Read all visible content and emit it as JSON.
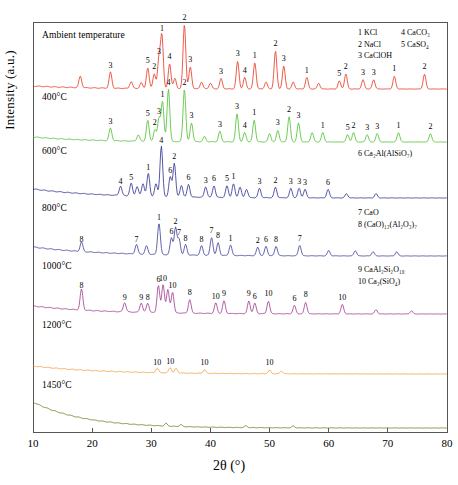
{
  "chart_data": {
    "type": "line",
    "title": "",
    "xlabel": "2θ (°)",
    "ylabel": "Intensity (a.u.)",
    "xlim": [
      10,
      80
    ],
    "xticks": [
      10,
      20,
      30,
      40,
      50,
      60,
      70,
      80
    ],
    "grid": false,
    "legend_position": "inside-right",
    "phase_legend": [
      {
        "id": "1",
        "name": "1 KCl"
      },
      {
        "id": "2",
        "name": "2 NaCl"
      },
      {
        "id": "3",
        "name": "3 CaClOH"
      },
      {
        "id": "4",
        "name": "4 CaCO₃"
      },
      {
        "id": "5",
        "name": "5 CaSO₄"
      },
      {
        "id": "6",
        "name": "6 Ca₂Al(AlSiO₇)"
      },
      {
        "id": "7",
        "name": "7 CaO"
      },
      {
        "id": "8",
        "name": "8 (CaO)₁₂(Al₂O₃)₇"
      },
      {
        "id": "9",
        "name": "9 CaAl₂Si₂O₁₈"
      },
      {
        "id": "10",
        "name": "10 Ca₂(SiO₄)"
      }
    ],
    "series": [
      {
        "name": "Ambient temperature",
        "color": "#e8331c",
        "peaks": [
          {
            "x": 18.0,
            "h": 10,
            "label": ""
          },
          {
            "x": 23.1,
            "h": 14,
            "label": "3"
          },
          {
            "x": 26.6,
            "h": 6,
            "label": ""
          },
          {
            "x": 28.3,
            "h": 5,
            "label": ""
          },
          {
            "x": 29.4,
            "h": 18,
            "label": "5"
          },
          {
            "x": 30.5,
            "h": 13,
            "label": "2"
          },
          {
            "x": 31.3,
            "h": 26,
            "label": "3"
          },
          {
            "x": 31.8,
            "h": 46,
            "label": "1"
          },
          {
            "x": 33.1,
            "h": 22,
            "label": "4"
          },
          {
            "x": 34.0,
            "h": 9,
            "label": ""
          },
          {
            "x": 35.6,
            "h": 56,
            "label": "2"
          },
          {
            "x": 36.6,
            "h": 19,
            "label": "3"
          },
          {
            "x": 38.5,
            "h": 6,
            "label": ""
          },
          {
            "x": 40.0,
            "h": 5,
            "label": ""
          },
          {
            "x": 41.8,
            "h": 9,
            "label": "3"
          },
          {
            "x": 44.6,
            "h": 24,
            "label": "3"
          },
          {
            "x": 45.8,
            "h": 10,
            "label": "4"
          },
          {
            "x": 47.5,
            "h": 23,
            "label": "1"
          },
          {
            "x": 49.4,
            "h": 6,
            "label": ""
          },
          {
            "x": 51.0,
            "h": 33,
            "label": "2"
          },
          {
            "x": 52.4,
            "h": 20,
            "label": "3"
          },
          {
            "x": 54.0,
            "h": 6,
            "label": ""
          },
          {
            "x": 56.3,
            "h": 10,
            "label": "1"
          },
          {
            "x": 58.3,
            "h": 5,
            "label": ""
          },
          {
            "x": 61.8,
            "h": 7,
            "label": "5"
          },
          {
            "x": 62.9,
            "h": 13,
            "label": "2"
          },
          {
            "x": 65.8,
            "h": 8,
            "label": "3"
          },
          {
            "x": 67.6,
            "h": 8,
            "label": "3"
          },
          {
            "x": 71.1,
            "h": 11,
            "label": "1"
          },
          {
            "x": 76.2,
            "h": 13,
            "label": "2"
          }
        ]
      },
      {
        "name": "400°C",
        "color": "#4bbf2c",
        "peaks": [
          {
            "x": 23.1,
            "h": 12,
            "label": "3"
          },
          {
            "x": 27.8,
            "h": 6,
            "label": ""
          },
          {
            "x": 29.4,
            "h": 20,
            "label": "5"
          },
          {
            "x": 30.6,
            "h": 11,
            "label": "2"
          },
          {
            "x": 31.3,
            "h": 22,
            "label": "3"
          },
          {
            "x": 31.9,
            "h": 38,
            "label": "1"
          },
          {
            "x": 32.9,
            "h": 50,
            "label": "4"
          },
          {
            "x": 35.6,
            "h": 50,
            "label": "2"
          },
          {
            "x": 36.8,
            "h": 18,
            "label": "3"
          },
          {
            "x": 39.0,
            "h": 5,
            "label": ""
          },
          {
            "x": 41.6,
            "h": 10,
            "label": "3"
          },
          {
            "x": 44.5,
            "h": 27,
            "label": "3"
          },
          {
            "x": 45.8,
            "h": 9,
            "label": "4"
          },
          {
            "x": 47.4,
            "h": 21,
            "label": "1"
          },
          {
            "x": 50.0,
            "h": 8,
            "label": ""
          },
          {
            "x": 51.4,
            "h": 11,
            "label": "3"
          },
          {
            "x": 53.3,
            "h": 24,
            "label": "2"
          },
          {
            "x": 54.9,
            "h": 18,
            "label": "3"
          },
          {
            "x": 57.2,
            "h": 9,
            "label": ""
          },
          {
            "x": 59.0,
            "h": 9,
            "label": "1"
          },
          {
            "x": 63.2,
            "h": 7,
            "label": "5"
          },
          {
            "x": 64.2,
            "h": 9,
            "label": "2"
          },
          {
            "x": 66.5,
            "h": 7,
            "label": "3"
          },
          {
            "x": 68.2,
            "h": 8,
            "label": "3"
          },
          {
            "x": 71.8,
            "h": 9,
            "label": "1"
          },
          {
            "x": 77.2,
            "h": 8,
            "label": "2"
          }
        ]
      },
      {
        "name": "600°C",
        "color": "#2b2e8c",
        "peaks": [
          {
            "x": 24.8,
            "h": 9,
            "label": "4"
          },
          {
            "x": 26.6,
            "h": 12,
            "label": "5"
          },
          {
            "x": 27.6,
            "h": 9,
            "label": ""
          },
          {
            "x": 28.6,
            "h": 12,
            "label": ""
          },
          {
            "x": 29.5,
            "h": 22,
            "label": "1"
          },
          {
            "x": 30.8,
            "h": 12,
            "label": ""
          },
          {
            "x": 31.7,
            "h": 48,
            "label": "4"
          },
          {
            "x": 33.2,
            "h": 19,
            "label": "6"
          },
          {
            "x": 33.9,
            "h": 32,
            "label": "2"
          },
          {
            "x": 35.1,
            "h": 11,
            "label": ""
          },
          {
            "x": 36.3,
            "h": 12,
            "label": "6"
          },
          {
            "x": 39.2,
            "h": 10,
            "label": "3"
          },
          {
            "x": 40.6,
            "h": 11,
            "label": "6"
          },
          {
            "x": 42.8,
            "h": 11,
            "label": "5"
          },
          {
            "x": 43.9,
            "h": 13,
            "label": "1"
          },
          {
            "x": 45.0,
            "h": 10,
            "label": ""
          },
          {
            "x": 46.1,
            "h": 8,
            "label": ""
          },
          {
            "x": 48.3,
            "h": 9,
            "label": "3"
          },
          {
            "x": 51.0,
            "h": 10,
            "label": "2"
          },
          {
            "x": 53.6,
            "h": 9,
            "label": "3"
          },
          {
            "x": 55.0,
            "h": 9,
            "label": "3"
          },
          {
            "x": 56.0,
            "h": 8,
            "label": "3"
          },
          {
            "x": 59.9,
            "h": 8,
            "label": "6"
          },
          {
            "x": 63.0,
            "h": 4,
            "label": ""
          },
          {
            "x": 68.0,
            "h": 4,
            "label": ""
          }
        ]
      },
      {
        "name": "800°C",
        "color": "#3c3f96",
        "peaks": [
          {
            "x": 18.2,
            "h": 9,
            "label": "8"
          },
          {
            "x": 27.5,
            "h": 9,
            "label": "7"
          },
          {
            "x": 29.2,
            "h": 8,
            "label": ""
          },
          {
            "x": 31.3,
            "h": 30,
            "label": "1"
          },
          {
            "x": 33.4,
            "h": 16,
            "label": "6"
          },
          {
            "x": 34.1,
            "h": 26,
            "label": "2"
          },
          {
            "x": 34.7,
            "h": 15,
            "label": "7"
          },
          {
            "x": 35.8,
            "h": 10,
            "label": "8"
          },
          {
            "x": 38.5,
            "h": 9,
            "label": "8"
          },
          {
            "x": 40.2,
            "h": 17,
            "label": "7"
          },
          {
            "x": 41.3,
            "h": 12,
            "label": "8"
          },
          {
            "x": 43.4,
            "h": 10,
            "label": "1"
          },
          {
            "x": 48.0,
            "h": 8,
            "label": "2"
          },
          {
            "x": 49.4,
            "h": 9,
            "label": "6"
          },
          {
            "x": 51.1,
            "h": 9,
            "label": "8"
          },
          {
            "x": 55.1,
            "h": 10,
            "label": "7"
          },
          {
            "x": 60.0,
            "h": 5,
            "label": ""
          },
          {
            "x": 64.5,
            "h": 5,
            "label": ""
          },
          {
            "x": 67.5,
            "h": 4,
            "label": ""
          },
          {
            "x": 71.5,
            "h": 4,
            "label": ""
          }
        ]
      },
      {
        "name": "1000°C",
        "color": "#a0388e",
        "peaks": [
          {
            "x": 18.2,
            "h": 20,
            "label": "8"
          },
          {
            "x": 25.5,
            "h": 9,
            "label": "9"
          },
          {
            "x": 28.3,
            "h": 9,
            "label": "9"
          },
          {
            "x": 29.4,
            "h": 9,
            "label": "8"
          },
          {
            "x": 31.2,
            "h": 26,
            "label": "6"
          },
          {
            "x": 32.0,
            "h": 27,
            "label": "10"
          },
          {
            "x": 32.8,
            "h": 22,
            "label": ""
          },
          {
            "x": 33.6,
            "h": 20,
            "label": "10"
          },
          {
            "x": 36.5,
            "h": 13,
            "label": "8"
          },
          {
            "x": 40.9,
            "h": 10,
            "label": "10"
          },
          {
            "x": 42.3,
            "h": 12,
            "label": "9"
          },
          {
            "x": 46.5,
            "h": 12,
            "label": "9"
          },
          {
            "x": 47.5,
            "h": 10,
            "label": "6"
          },
          {
            "x": 49.8,
            "h": 12,
            "label": "10"
          },
          {
            "x": 54.2,
            "h": 8,
            "label": "6"
          },
          {
            "x": 56.1,
            "h": 11,
            "label": "8"
          },
          {
            "x": 62.3,
            "h": 9,
            "label": "10"
          },
          {
            "x": 68.0,
            "h": 4,
            "label": ""
          },
          {
            "x": 74.0,
            "h": 3,
            "label": ""
          }
        ]
      },
      {
        "name": "1200°C",
        "color": "#f0a03c",
        "peaks": [
          {
            "x": 31.0,
            "h": 5,
            "label": "10"
          },
          {
            "x": 33.2,
            "h": 6,
            "label": "10"
          },
          {
            "x": 34.2,
            "h": 5,
            "label": ""
          },
          {
            "x": 39.0,
            "h": 4,
            "label": "10"
          },
          {
            "x": 50.0,
            "h": 4,
            "label": "10"
          },
          {
            "x": 52.0,
            "h": 3,
            "label": ""
          }
        ]
      },
      {
        "name": "1450°C",
        "color": "#6b7a1e",
        "peaks": [
          {
            "x": 32.5,
            "h": 3,
            "label": ""
          },
          {
            "x": 35.0,
            "h": 2,
            "label": ""
          },
          {
            "x": 46.0,
            "h": 2,
            "label": ""
          },
          {
            "x": 54.0,
            "h": 2,
            "label": ""
          }
        ]
      }
    ],
    "panel_labels": [
      "Ambient temperature",
      "400°C",
      "600°C",
      "800°C",
      "1000°C",
      "1200°C",
      "1450°C"
    ],
    "legend_groups": [
      {
        "rows": [
          [
            "1 KCl",
            "4 CaCO₃"
          ],
          [
            "2 NaCl",
            "5 CaSO₄"
          ],
          [
            "3 CaClOH",
            ""
          ]
        ]
      },
      {
        "rows": [
          [
            "6 Ca₂Al(AlSiO₇)"
          ]
        ]
      },
      {
        "rows": [
          [
            "7 CaO"
          ],
          [
            "8 (CaO)₁₂(Al₂O₃)₇"
          ]
        ]
      },
      {
        "rows": [
          [
            "9 CaAl₂Si₂O₁₈"
          ],
          [
            "10 Ca₂(SiO₄)"
          ]
        ]
      }
    ]
  },
  "axis": {
    "xlabel": "2θ (°)",
    "ylabel": "Intensity (a.u.)",
    "xticklabels": [
      "10",
      "20",
      "30",
      "40",
      "50",
      "60",
      "70",
      "80"
    ]
  }
}
